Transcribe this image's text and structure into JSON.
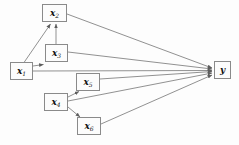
{
  "diagram": {
    "type": "directed-acyclic-graph",
    "title": "",
    "background_color": "#fdfdfd",
    "node_border_color": "#8a8a8a",
    "node_fill_color": "#fcfcfc",
    "edge_color": "#7d7d7d",
    "nodes": [
      {
        "id": "x1",
        "base": "x",
        "sub": "1",
        "x": 10,
        "y": 62,
        "w": 23,
        "h": 18
      },
      {
        "id": "x2",
        "base": "x",
        "sub": "2",
        "x": 42,
        "y": 4,
        "w": 25,
        "h": 18
      },
      {
        "id": "x3",
        "base": "x",
        "sub": "3",
        "x": 45,
        "y": 44,
        "w": 23,
        "h": 18
      },
      {
        "id": "x4",
        "base": "x",
        "sub": "4",
        "x": 44,
        "y": 93,
        "w": 24,
        "h": 18
      },
      {
        "id": "x5",
        "base": "x",
        "sub": "5",
        "x": 76,
        "y": 73,
        "w": 24,
        "h": 18
      },
      {
        "id": "x6",
        "base": "x",
        "sub": "6",
        "x": 77,
        "y": 117,
        "w": 24,
        "h": 18
      },
      {
        "id": "y",
        "base": "y",
        "sub": "",
        "x": 214,
        "y": 61,
        "w": 17,
        "h": 18
      }
    ],
    "edges": [
      {
        "from": "x1",
        "to": "x2"
      },
      {
        "from": "x1",
        "to": "x3"
      },
      {
        "from": "x3",
        "to": "x2"
      },
      {
        "from": "x2",
        "to": "y"
      },
      {
        "from": "x3",
        "to": "y"
      },
      {
        "from": "x1",
        "to": "y"
      },
      {
        "from": "x5",
        "to": "y"
      },
      {
        "from": "x4",
        "to": "x5"
      },
      {
        "from": "x4",
        "to": "x6"
      },
      {
        "from": "x4",
        "to": "y"
      },
      {
        "from": "x6",
        "to": "y"
      }
    ]
  }
}
